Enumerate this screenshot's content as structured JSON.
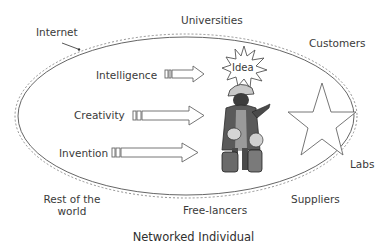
{
  "diagram": {
    "caption": "Networked Individual",
    "outer_labels": {
      "internet": "Internet",
      "universities": "Universities",
      "customers": "Customers",
      "labs": "Labs",
      "suppliers": "Suppliers",
      "freelancers": "Free-lancers",
      "rest_of_world_line1": "Rest of the",
      "rest_of_world_line2": "world"
    },
    "inputs": [
      {
        "label": "Intelligence"
      },
      {
        "label": "Creativity"
      },
      {
        "label": "Invention"
      }
    ],
    "burst_label": "Idea",
    "icons": {
      "person": "person-with-helmet-clipart",
      "star": "star-outline",
      "burst": "idea-starburst"
    },
    "colors": {
      "line": "#555555",
      "text": "#3a3a3a",
      "figure_dark": "#4a4a4a",
      "figure_mid": "#8a8a8a",
      "figure_light": "#d0d0d0"
    }
  }
}
